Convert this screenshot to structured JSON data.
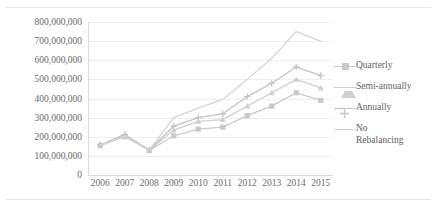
{
  "chart_data": {
    "type": "line",
    "title": "",
    "subtitle": "",
    "xlabel": "",
    "ylabel": "",
    "categories": [
      "2006",
      "2007",
      "2008",
      "2009",
      "2010",
      "2011",
      "2012",
      "2013",
      "2014",
      "2015"
    ],
    "xtick_labels": [
      "2006",
      "2007",
      "2008",
      "2009",
      "2010",
      "2011",
      "2012",
      "2013",
      "2014",
      "2015"
    ],
    "ytick_labels": [
      "0",
      "100,000,000",
      "200,000,000",
      "300,000,000",
      "400,000,000",
      "500,000,000",
      "600,000,000",
      "700,000,000",
      "800,000,000"
    ],
    "ytick_values": [
      0,
      100000000,
      200000000,
      300000000,
      400000000,
      500000000,
      600000000,
      700000000,
      800000000
    ],
    "ylim": [
      0,
      800000000
    ],
    "grid": true,
    "grid_axis": "y",
    "legend_position": "right",
    "series": [
      {
        "name": "Quarterly",
        "marker": "square",
        "color": "#c9c9c9",
        "values": [
          155000000,
          200000000,
          128000000,
          205000000,
          240000000,
          250000000,
          310000000,
          360000000,
          430000000,
          390000000
        ]
      },
      {
        "name": "Semi-annually",
        "marker": "triangle",
        "color": "#cfcfcf",
        "values": [
          152000000,
          205000000,
          130000000,
          235000000,
          280000000,
          290000000,
          360000000,
          430000000,
          500000000,
          455000000
        ]
      },
      {
        "name": "Annually",
        "marker": "cross",
        "color": "#c4c4c4",
        "values": [
          158000000,
          212000000,
          132000000,
          255000000,
          300000000,
          320000000,
          410000000,
          480000000,
          565000000,
          520000000
        ]
      },
      {
        "name": "No Rebalancing",
        "marker": "none",
        "color": "#d4d4d4",
        "values": [
          155000000,
          205000000,
          130000000,
          300000000,
          350000000,
          395000000,
          500000000,
          610000000,
          750000000,
          700000000
        ]
      }
    ]
  },
  "legend": {
    "items": [
      {
        "label": "Quarterly"
      },
      {
        "label": "Semi-annually"
      },
      {
        "label": "Annually"
      },
      {
        "label": "No\nRebalancing"
      }
    ]
  },
  "colors": {
    "gridline": "#eceff1",
    "axis": "#d9d9d9",
    "tick_text": "#6b6b6b",
    "legend_text": "#5f5f5f",
    "background": "#ffffff"
  }
}
